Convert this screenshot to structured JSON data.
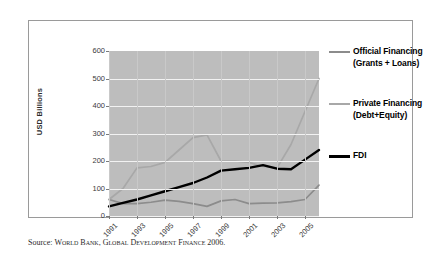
{
  "chart_data": {
    "type": "line",
    "title": "",
    "subtitle": "",
    "xlabel": "",
    "ylabel": "USD Billions",
    "ylim": [
      0,
      600
    ],
    "ytick_values": [
      0,
      100,
      200,
      300,
      400,
      500,
      600
    ],
    "ytick_labels": [
      "0",
      "100",
      "200",
      "300",
      "400",
      "500",
      "600"
    ],
    "grid": true,
    "grid_axis": "y",
    "legend_position": "right",
    "x": [
      1991,
      1992,
      1993,
      1994,
      1995,
      1996,
      1997,
      1998,
      1999,
      2000,
      2001,
      2002,
      2003,
      2004,
      2005,
      2006
    ],
    "xtick_labels": [
      "1991",
      "1993",
      "1995",
      "1997",
      "1999",
      "2001",
      "2003",
      "2005"
    ],
    "xtick_values": [
      1991,
      1993,
      1995,
      1997,
      1999,
      2001,
      2003,
      2005
    ],
    "series": [
      {
        "name": "Official Financing (Grants + Loans)",
        "color": "#8c8c8c",
        "values": [
          60,
          45,
          45,
          50,
          58,
          53,
          45,
          35,
          55,
          60,
          45,
          47,
          48,
          52,
          60,
          112
        ]
      },
      {
        "name": "Private Financing (Debt+Equity)",
        "color": "#a8a8a8",
        "values": [
          60,
          100,
          175,
          180,
          195,
          240,
          285,
          295,
          200,
          200,
          195,
          180,
          175,
          260,
          380,
          500
        ]
      },
      {
        "name": "FDI",
        "color": "#000000",
        "values": [
          35,
          48,
          60,
          75,
          90,
          105,
          120,
          140,
          165,
          170,
          175,
          185,
          172,
          170,
          205,
          240
        ]
      }
    ]
  },
  "legend": {
    "items": [
      {
        "label": "Official Financing (Grants + Loans)",
        "color": "#8c8c8c"
      },
      {
        "label": "Private Financing (Debt+Equity)",
        "color": "#a8a8a8"
      },
      {
        "label": "FDI",
        "color": "#000000"
      }
    ]
  },
  "source": {
    "prefix": "Source:",
    "text": "World Bank, Global Development Finance 2006."
  }
}
